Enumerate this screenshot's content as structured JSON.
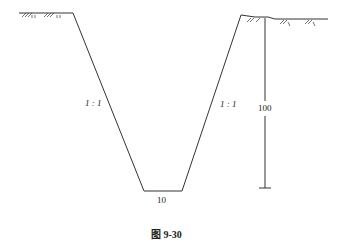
{
  "diagram": {
    "type": "trapezoidal excavation cross-section",
    "left_slope_label": "1 : 1",
    "right_slope_label": "1 : 1",
    "depth_label": "100",
    "bottom_width_label": "10",
    "caption": "图 9-30",
    "colors": {
      "line": "#333333",
      "background": "#ffffff"
    }
  }
}
